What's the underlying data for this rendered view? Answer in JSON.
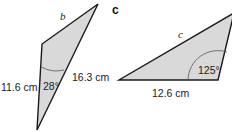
{
  "figure_b": {
    "side_unknown": "b",
    "side_left": "11.6 cm",
    "side_right": "16.3 cm",
    "angle": "28°",
    "fill_color": "#d9d9d9",
    "stroke_color": "#1a1a1a"
  },
  "figure_c": {
    "part_label": "c",
    "side_unknown": "c",
    "side_bottom": "12.6 cm",
    "angle": "125°",
    "fill_color": "#d9d9d9",
    "stroke_color": "#1a1a1a"
  }
}
